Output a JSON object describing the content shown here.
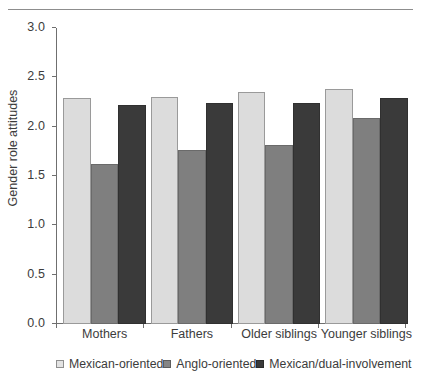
{
  "chart_data": {
    "type": "bar",
    "title": "",
    "xlabel": "",
    "ylabel": "Gender role attitudes",
    "ylim": [
      0.0,
      3.0
    ],
    "ytick_labels": [
      "0.0",
      "0.5",
      "1.0",
      "1.5",
      "2.0",
      "2.5",
      "3.0"
    ],
    "ytick_values": [
      0.0,
      0.5,
      1.0,
      1.5,
      2.0,
      2.5,
      3.0
    ],
    "grid": false,
    "legend_position": "bottom",
    "categories": [
      "Mothers",
      "Fathers",
      "Older siblings",
      "Younger siblings"
    ],
    "series": [
      {
        "name": "Mexican-oriented",
        "color": "#dcdcdc",
        "values": [
          2.29,
          2.3,
          2.35,
          2.38
        ]
      },
      {
        "name": "Anglo-oriented",
        "color": "#7f7f7f",
        "values": [
          1.62,
          1.76,
          1.81,
          2.09
        ]
      },
      {
        "name": "Mexican/dual-involvement",
        "color": "#3a3a3a",
        "values": [
          2.22,
          2.24,
          2.24,
          2.29
        ]
      }
    ]
  },
  "legend": {
    "items": [
      {
        "label": "Mexican-oriented",
        "swatch": "legend-swatch-light"
      },
      {
        "label": "Anglo-oriented",
        "swatch": "legend-swatch-gray"
      },
      {
        "label": "Mexican/dual-involvement",
        "swatch": "legend-swatch-dark"
      }
    ]
  },
  "axes": {
    "y_title": "Gender role attitudes",
    "y_ticks": [
      "3.0",
      "2.5",
      "2.0",
      "1.5",
      "1.0",
      "0.5",
      "0.0"
    ],
    "x_categories": [
      "Mothers",
      "Fathers",
      "Older siblings",
      "Younger siblings"
    ]
  }
}
